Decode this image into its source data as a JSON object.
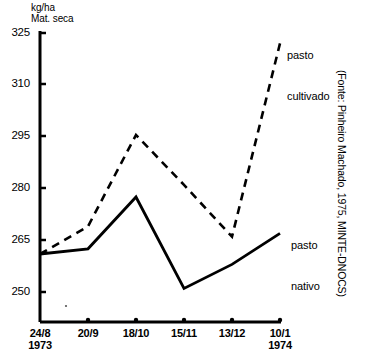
{
  "chart_data": {
    "type": "line",
    "title": "",
    "subtitle": "",
    "ylabel": "kg/ha\nMat. seca",
    "xlabel": "",
    "categories": [
      "24/8",
      "20/9",
      "18/10",
      "15/11",
      "13/12",
      "10/1"
    ],
    "category_years": [
      "1973",
      "",
      "",
      "",
      "",
      "1974"
    ],
    "yticks": [
      250,
      265,
      280,
      295,
      310,
      325
    ],
    "ylim": [
      240,
      325
    ],
    "grid": false,
    "legend_position": "inline-right",
    "series": [
      {
        "name": "pasto cultivado",
        "style": "dashed",
        "color": "#000000",
        "values": [
          261,
          269,
          295.5,
          281,
          266,
          322
        ]
      },
      {
        "name": "pasto nativo",
        "style": "solid",
        "color": "#000000",
        "values": [
          261,
          262.5,
          277.5,
          251,
          258,
          267
        ]
      }
    ],
    "annotations": [
      {
        "text": "pasto\ncultivado",
        "target": "pasto cultivado"
      },
      {
        "text": "pasto\nnativo",
        "target": "pasto nativo"
      }
    ],
    "source_note": "(Fonte: Pinheiro Machado, 1975, MINTE-DNOCS)"
  },
  "labels": {
    "y_axis_title": "kg/ha\nMat. seca",
    "series_cultivado_line1": "pasto",
    "series_cultivado_line2": "cultivado",
    "series_nativo_line1": "pasto",
    "series_nativo_line2": "nativo",
    "source": "(Fonte: Pinheiro Machado, 1975, MINTE-DNOCS)"
  },
  "yticks": {
    "t0": "250",
    "t1": "265",
    "t2": "280",
    "t3": "295",
    "t4": "310",
    "t5": "325"
  },
  "xticks": {
    "t0": "24/8",
    "t0y": "1973",
    "t1": "20/9",
    "t2": "18/10",
    "t3": "15/11",
    "t4": "13/12",
    "t5": "10/1",
    "t5y": "1974"
  }
}
